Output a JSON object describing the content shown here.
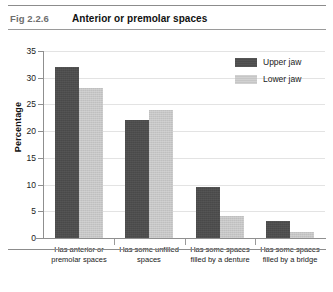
{
  "header": {
    "fig_number": "Fig 2.2.6",
    "fig_title": "Anterior or premolar spaces"
  },
  "chart_data": {
    "type": "bar",
    "title": "Anterior or premolar spaces",
    "xlabel": "",
    "ylabel": "Percentage",
    "ylim": [
      0,
      35
    ],
    "yticks": [
      0,
      5,
      10,
      15,
      20,
      25,
      30,
      35
    ],
    "ytick_labels": [
      "0",
      "5",
      "10",
      "15",
      "20",
      "25",
      "30",
      "35"
    ],
    "grid": true,
    "legend_position": "top-right",
    "categories": [
      "Has anterior or premolar spaces",
      "Has some unfilled spaces",
      "Has some spaces filled by a denture",
      "Has some spaces filled by a bridge"
    ],
    "category_lines": [
      [
        "Has anterior or",
        "premolar spaces"
      ],
      [
        "Has some unfilled",
        "spaces"
      ],
      [
        "Has some spaces",
        "filled by a denture"
      ],
      [
        "Has some spaces",
        "filled by a bridge"
      ]
    ],
    "series": [
      {
        "name": "Upper jaw",
        "color": "#4d4d4d",
        "values": [
          32,
          22,
          9.5,
          3.2
        ]
      },
      {
        "name": "Lower jaw",
        "color": "#c6c6c6",
        "values": [
          28,
          24,
          4.2,
          1.2
        ]
      }
    ]
  }
}
